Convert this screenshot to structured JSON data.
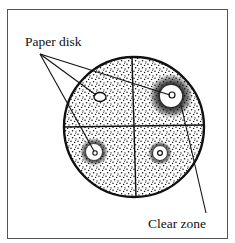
{
  "diagram": {
    "type": "antibiotic disk diffusion plate",
    "labels": {
      "paper_disk": "Paper disk",
      "clear_zone": "Clear zone"
    },
    "plate": {
      "cx": 134,
      "cy": 127,
      "r": 70,
      "quadrants": 4
    },
    "disks": [
      {
        "id": "top-left",
        "cx": 100,
        "cy": 97,
        "disk_r": 5,
        "clear_r": 0,
        "halo_r": 0
      },
      {
        "id": "top-right",
        "cx": 171,
        "cy": 96,
        "disk_r": 3,
        "clear_r": 11,
        "halo_r": 22
      },
      {
        "id": "bottom-left",
        "cx": 94,
        "cy": 152,
        "disk_r": 2,
        "clear_r": 8,
        "halo_r": 14
      },
      {
        "id": "bottom-right",
        "cx": 160,
        "cy": 153,
        "disk_r": 2,
        "clear_r": 7,
        "halo_r": 12
      }
    ],
    "colors": {
      "ink": "#111111",
      "frame": "#555555",
      "background": "#ffffff"
    }
  }
}
